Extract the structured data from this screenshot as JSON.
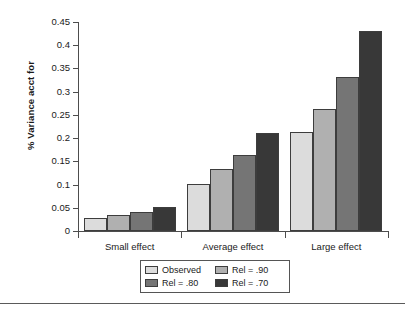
{
  "chart_data": {
    "type": "bar",
    "title": "",
    "xlabel": "",
    "ylabel": "% Variance acct for",
    "categories": [
      "Small effect",
      "Average effect",
      "Large effect"
    ],
    "series": [
      {
        "name": "Observed",
        "values": [
          0.027,
          0.102,
          0.213
        ],
        "color": "#DCDCDC"
      },
      {
        "name": "Rel = .90",
        "values": [
          0.034,
          0.133,
          0.263
        ],
        "color": "#B0B0B0"
      },
      {
        "name": "Rel = .80",
        "values": [
          0.041,
          0.163,
          0.332
        ],
        "color": "#757575"
      },
      {
        "name": "Rel = .70",
        "values": [
          0.052,
          0.211,
          0.431
        ],
        "color": "#383838"
      }
    ],
    "ylim": [
      0,
      0.45
    ],
    "ytick_values": [
      0,
      0.05,
      0.1,
      0.15,
      0.2,
      0.25,
      0.3,
      0.35,
      0.4,
      0.45
    ],
    "ytick_labels": [
      "0",
      "0.05",
      "0.1",
      "0.15",
      "0.2",
      "0.25",
      "0.3",
      "0.35",
      "0.4",
      "0.45"
    ],
    "grid": false,
    "legend_position": "bottom",
    "legend_entries": [
      "Observed",
      "Rel = .90",
      "Rel = .80",
      "Rel = .70"
    ],
    "axis_color": "#4d4d4d",
    "bar_edge_color": "#3d3d3d"
  }
}
